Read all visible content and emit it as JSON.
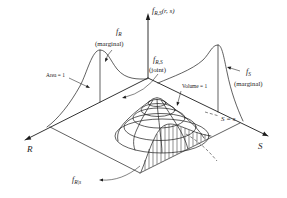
{
  "figure": {
    "colors": {
      "ink": "#1c1c1c",
      "background": "#ffffff"
    }
  },
  "labels": {
    "f_symbol": "f",
    "vertical_axis": {
      "sub": "R,S",
      "args": "(r, s)"
    },
    "marginal_r": {
      "sub": "R",
      "caption": "(marginal)"
    },
    "joint": {
      "sub": "R,S",
      "caption": "(joint)"
    },
    "marginal_s": {
      "sub": "S",
      "caption": "(marginal)"
    },
    "conditional": {
      "sub": "R|s"
    },
    "annotations": {
      "area": "Area = 1",
      "volume": "Volume = 1",
      "s_equals": "S = s"
    },
    "axes": {
      "r": "R",
      "s": "S"
    }
  }
}
